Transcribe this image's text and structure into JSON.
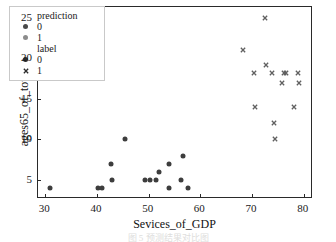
{
  "chart_data": {
    "type": "scatter",
    "title": "",
    "xlabel": "Sevices_of_GDP",
    "ylabel": "ages65_of_total",
    "xlim": [
      28.6,
      81.4
    ],
    "ylim": [
      2.9,
      26.3
    ],
    "xticks": [
      30,
      40,
      50,
      60,
      70,
      80
    ],
    "yticks": [
      5,
      10,
      15,
      20,
      25
    ],
    "grid": false,
    "legend_position": "upper-left",
    "series": [
      {
        "name": "label 0 / prediction 0",
        "marker": "circle",
        "color": "#3d3d3d",
        "points": [
          {
            "x": 31.0,
            "y": 4.0
          },
          {
            "x": 40.3,
            "y": 4.0
          },
          {
            "x": 41.0,
            "y": 4.0
          },
          {
            "x": 42.8,
            "y": 7.0
          },
          {
            "x": 43.0,
            "y": 5.0
          },
          {
            "x": 45.5,
            "y": 10.0
          },
          {
            "x": 49.2,
            "y": 5.0
          },
          {
            "x": 50.3,
            "y": 5.0
          },
          {
            "x": 51.5,
            "y": 5.0
          },
          {
            "x": 52.0,
            "y": 6.0
          },
          {
            "x": 53.9,
            "y": 7.0
          },
          {
            "x": 54.0,
            "y": 4.0
          },
          {
            "x": 56.2,
            "y": 5.0
          },
          {
            "x": 56.7,
            "y": 8.0
          },
          {
            "x": 57.6,
            "y": 4.0
          }
        ]
      },
      {
        "name": "label 1 / prediction 1",
        "marker": "x",
        "color": "#606060",
        "points": [
          {
            "x": 68.2,
            "y": 21.0
          },
          {
            "x": 70.4,
            "y": 18.2
          },
          {
            "x": 70.6,
            "y": 14.0
          },
          {
            "x": 72.5,
            "y": 25.0
          },
          {
            "x": 72.6,
            "y": 19.2
          },
          {
            "x": 73.9,
            "y": 18.2
          },
          {
            "x": 74.3,
            "y": 12.0
          },
          {
            "x": 74.5,
            "y": 10.0
          },
          {
            "x": 75.7,
            "y": 17.0
          },
          {
            "x": 76.1,
            "y": 18.2
          },
          {
            "x": 76.5,
            "y": 18.2
          },
          {
            "x": 78.1,
            "y": 14.0
          },
          {
            "x": 78.9,
            "y": 18.2
          },
          {
            "x": 79.0,
            "y": 17.0
          }
        ]
      }
    ],
    "legend": {
      "groups": [
        {
          "title": "prediction",
          "entries": [
            {
              "label": "0",
              "marker": "circle",
              "color": "#4a4a4a"
            },
            {
              "label": "1",
              "marker": "circle",
              "color": "#8c8c8c"
            }
          ]
        },
        {
          "title": "label",
          "entries": [
            {
              "label": "0",
              "marker": "circle",
              "color": "#2b2b2b"
            },
            {
              "label": "1",
              "marker": "x",
              "color": "#2b2b2b"
            }
          ]
        }
      ]
    }
  },
  "caption": {
    "text": "图 5   预测结果对比图"
  }
}
